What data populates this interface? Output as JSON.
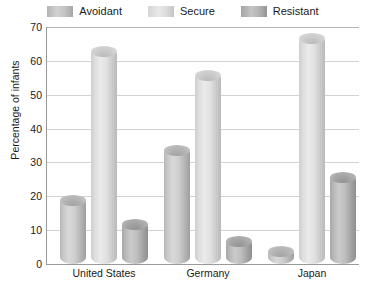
{
  "chart_data": {
    "type": "bar",
    "title": "",
    "xlabel": "",
    "ylabel": "Percentage of infants",
    "categories": [
      "United States",
      "Germany",
      "Japan"
    ],
    "series": [
      {
        "name": "Avoidant",
        "values": [
          20,
          35,
          5
        ],
        "color": "#c0c0c0"
      },
      {
        "name": "Secure",
        "values": [
          64,
          57,
          68
        ],
        "color": "#dedede"
      },
      {
        "name": "Resistant",
        "values": [
          13,
          8,
          27
        ],
        "color": "#aeaeae"
      }
    ],
    "ylim": [
      0,
      70
    ],
    "yticks": [
      0,
      10,
      20,
      30,
      40,
      50,
      60,
      70
    ],
    "ytick_labels": [
      "0",
      "10",
      "20",
      "30",
      "40",
      "50",
      "60",
      "70"
    ],
    "grid": true,
    "legend_position": "top-center"
  },
  "legend": {
    "items": [
      {
        "label": "Avoidant"
      },
      {
        "label": "Secure"
      },
      {
        "label": "Resistant"
      }
    ]
  },
  "axes": {
    "y_title": "Percentage of infants",
    "y_ticks": [
      "70",
      "60",
      "50",
      "40",
      "30",
      "20",
      "10",
      "0"
    ],
    "x_ticks": [
      "United States",
      "Germany",
      "Japan"
    ]
  },
  "colors": {
    "axis": "#9a9a9a",
    "grid": "#d2d2d2",
    "text": "#1a1a1a",
    "background": "#ffffff"
  }
}
